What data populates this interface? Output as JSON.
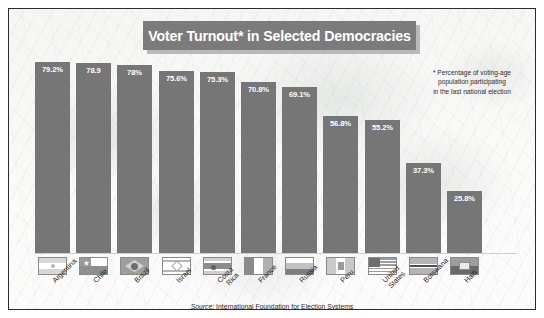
{
  "frame": {
    "border_color": "#2b2b2b",
    "background_color": "#fbfbfb"
  },
  "title": {
    "text": "Voter Turnout* in Selected Democracies",
    "banner_color": "#7b7b7b",
    "shadow_color": "#b9b9b9",
    "text_color": "#ffffff"
  },
  "footnote": {
    "line1": "* Percentage of voting-age",
    "line2": "population participating",
    "line3": "in the last national election"
  },
  "source": {
    "prefix": "Source:",
    "text": "International Foundation for Election Systems"
  },
  "chart_data": {
    "type": "bar",
    "title": "Voter Turnout* in Selected Democracies",
    "xlabel": "",
    "ylabel": "",
    "ylim": [
      0,
      100
    ],
    "grid": false,
    "legend": "none",
    "bar_color": "#767676",
    "categories": [
      "Argentina",
      "Chile",
      "Brazil",
      "Israel",
      "Costa Rica",
      "France",
      "Russia",
      "Peru",
      "United States",
      "Botswana",
      "Haiti"
    ],
    "values": [
      79.2,
      78.9,
      78.0,
      75.6,
      75.3,
      70.8,
      69.1,
      56.8,
      55.2,
      37.3,
      25.8
    ],
    "data_labels": [
      "79.2%",
      "78.9",
      "78%",
      "75.6%",
      "75.3%",
      "70.8%",
      "69.1%",
      "56.8%",
      "55.2%",
      "37.3%",
      "25.8%"
    ],
    "flags": [
      "argentina",
      "chile",
      "brazil",
      "israel",
      "costarica",
      "france",
      "russia",
      "peru",
      "unitedstates",
      "botswana",
      "haiti"
    ],
    "label_lines": [
      [
        "Argentina"
      ],
      [
        "Chile"
      ],
      [
        "Brazil"
      ],
      [
        "Israel"
      ],
      [
        "Costa",
        "Rica"
      ],
      [
        "France"
      ],
      [
        "Russia"
      ],
      [
        "Peru"
      ],
      [
        "United",
        "States"
      ],
      [
        "Botswana"
      ],
      [
        "Haiti"
      ]
    ],
    "annotations": [
      "* Percentage of voting-age population participating in the last national election"
    ]
  }
}
